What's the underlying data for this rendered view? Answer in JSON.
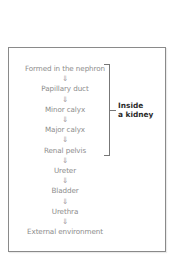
{
  "diagram": {
    "type": "flowchart",
    "steps": [
      "Formed in the nephron",
      "Papillary duct",
      "Minor calyx",
      "Major calyx",
      "Renal pelvis",
      "Ureter",
      "Bladder",
      "Urethra",
      "External environment"
    ],
    "arrow_glyph": "⇓",
    "arrow_icon": "double-down-arrow-icon",
    "bracket": {
      "label_line1": "Inside",
      "label_line2": "a kidney",
      "spans_steps": [
        "Formed in the nephron",
        "Papillary duct",
        "Minor calyx",
        "Major calyx",
        "Renal pelvis"
      ]
    },
    "colors": {
      "text": "#8c8c8c",
      "label": "#2a2a2a",
      "border": "#8a8a8a"
    }
  }
}
